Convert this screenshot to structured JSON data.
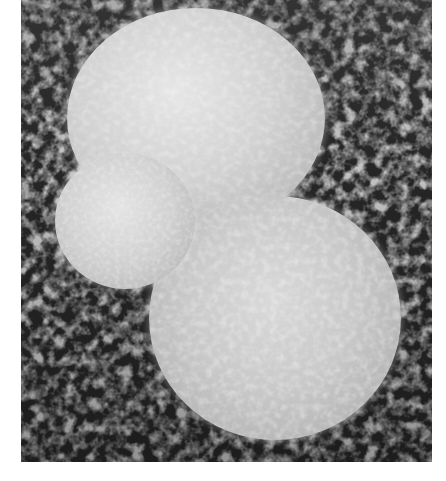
{
  "image": {
    "description": "Scanning electron micrograph of three spherical cells resting on a fibrous porous substrate",
    "colors": {
      "background": "#ffffff",
      "substrate": "#2c2c2c",
      "cell_highlight": "#e6e6e6",
      "cell_shadow": "#a8a8a8"
    },
    "cells": [
      {
        "name": "top-cell",
        "shape": "sphere",
        "position": "upper center"
      },
      {
        "name": "small-left-cell",
        "shape": "sphere",
        "position": "middle left"
      },
      {
        "name": "bottom-cell",
        "shape": "sphere",
        "position": "lower right"
      }
    ]
  }
}
